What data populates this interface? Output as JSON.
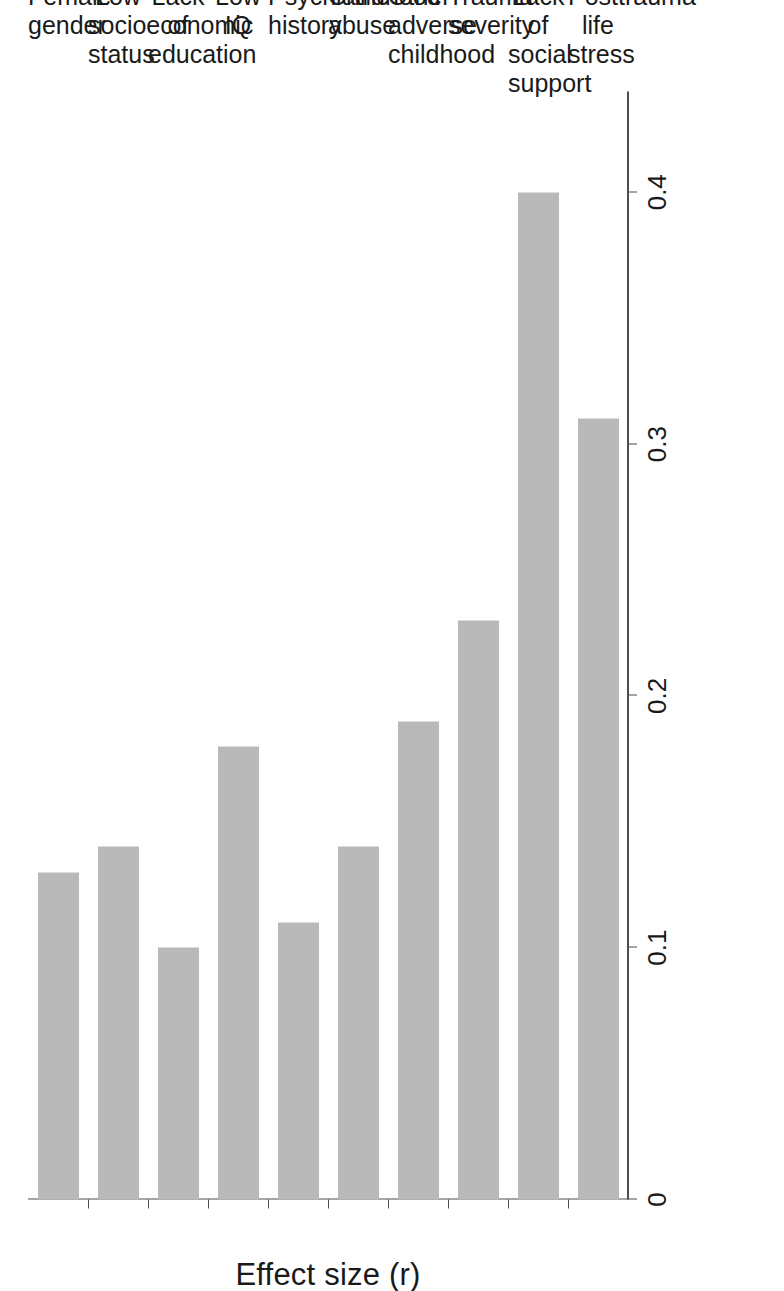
{
  "chart_data": {
    "type": "bar",
    "orientation": "horizontal",
    "title": "",
    "subtitle": "",
    "xlabel": "",
    "ylabel": "Effect size (r)",
    "value_axis_label": "Effect size (r)",
    "categories": [
      "Female gender",
      "Low socioeconomic status",
      "Lack of education",
      "Low IQ",
      "Psychiatric history",
      "Childhood abuse",
      "Other adverse childhood",
      "Trauma severity",
      "Lack of social support",
      "Posttrauma life stress"
    ],
    "category_lines": [
      [
        "Female",
        "gender"
      ],
      [
        "Low",
        "socioeconomic",
        "status"
      ],
      [
        "Lack of",
        "education"
      ],
      [
        "Low IQ"
      ],
      [
        "Psychiatric",
        "history"
      ],
      [
        "Childhood",
        "abuse"
      ],
      [
        "Other adverse",
        "childhood"
      ],
      [
        "Trauma",
        "severity"
      ],
      [
        "Lack of social",
        "support"
      ],
      [
        "Posttrauma",
        "life stress"
      ]
    ],
    "values": [
      0.13,
      0.14,
      0.1,
      0.18,
      0.11,
      0.14,
      0.19,
      0.23,
      0.4,
      0.31
    ],
    "tick_labels": [
      "0",
      "0.1",
      "0.2",
      "0.3",
      "0.4"
    ],
    "tick_values": [
      0,
      0.1,
      0.2,
      0.3,
      0.4
    ],
    "xlim": [
      0,
      0.44
    ],
    "ylim": [
      0,
      0.44
    ],
    "grid": false,
    "legend": "none",
    "bar_color": "#b9b9b9",
    "axis_color": "#4d4d4d",
    "text_color": "#1a1a1a",
    "background": "#ffffff",
    "page_orientation": "rotated-90-ccw"
  }
}
